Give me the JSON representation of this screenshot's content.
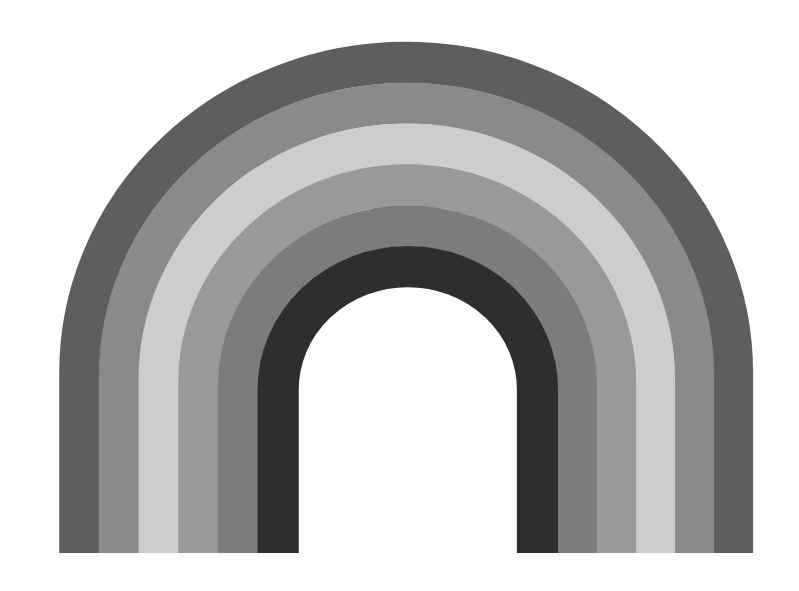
{
  "image": {
    "subject": "Painted rainbow arch in grayscale",
    "background": "#ffffff",
    "bands": [
      {
        "name": "band-outer",
        "color": "#5e5e5e"
      },
      {
        "name": "band-2",
        "color": "#8a8a8a"
      },
      {
        "name": "band-3",
        "color": "#cdcdcd"
      },
      {
        "name": "band-4",
        "color": "#999999"
      },
      {
        "name": "band-5",
        "color": "#7c7c7c"
      },
      {
        "name": "band-inner",
        "color": "#2e2e2e"
      }
    ]
  }
}
